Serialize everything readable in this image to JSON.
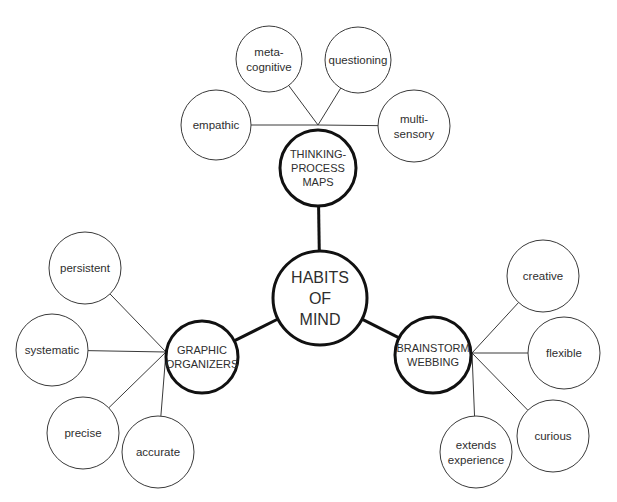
{
  "diagram": {
    "type": "concept-map",
    "center": {
      "id": "habits-of-mind",
      "lines": [
        "HABITS",
        "OF",
        "MIND"
      ],
      "x": 320,
      "y": 298,
      "r": 47
    },
    "branches": [
      {
        "id": "thinking-process-maps",
        "lines": [
          "THINKING-",
          "PROCESS",
          "MAPS"
        ],
        "x": 318,
        "y": 168,
        "r": 38,
        "hub": {
          "x": 318,
          "y": 125
        },
        "leaves": [
          {
            "id": "empathic",
            "lines": [
              "empathic"
            ],
            "x": 216,
            "y": 125,
            "r": 35
          },
          {
            "id": "meta-cognitive",
            "lines": [
              "meta-",
              "cognitive"
            ],
            "x": 269,
            "y": 59,
            "r": 33
          },
          {
            "id": "questioning",
            "lines": [
              "questioning"
            ],
            "x": 358,
            "y": 60,
            "r": 33
          },
          {
            "id": "multi-sensory",
            "lines": [
              "multi-",
              "sensory"
            ],
            "x": 414,
            "y": 126,
            "r": 36
          }
        ]
      },
      {
        "id": "graphic-organizers",
        "lines": [
          "GRAPHIC",
          "ORGANIZERS"
        ],
        "x": 202,
        "y": 357,
        "r": 36,
        "hub": {
          "x": 166,
          "y": 352
        },
        "leaves": [
          {
            "id": "persistent",
            "lines": [
              "persistent"
            ],
            "x": 85,
            "y": 268,
            "r": 36
          },
          {
            "id": "systematic",
            "lines": [
              "systematic"
            ],
            "x": 52,
            "y": 350,
            "r": 36
          },
          {
            "id": "precise",
            "lines": [
              "precise"
            ],
            "x": 83,
            "y": 433,
            "r": 36
          },
          {
            "id": "accurate",
            "lines": [
              "accurate"
            ],
            "x": 158,
            "y": 452,
            "r": 36
          }
        ]
      },
      {
        "id": "brainstorm-webbing",
        "lines": [
          "BRAINSTORM",
          "WEBBING"
        ],
        "x": 433,
        "y": 355,
        "r": 38,
        "hub": {
          "x": 472,
          "y": 353
        },
        "leaves": [
          {
            "id": "creative",
            "lines": [
              "creative"
            ],
            "x": 543,
            "y": 276,
            "r": 36
          },
          {
            "id": "flexible",
            "lines": [
              "flexible"
            ],
            "x": 564,
            "y": 353,
            "r": 36
          },
          {
            "id": "curious",
            "lines": [
              "curious"
            ],
            "x": 553,
            "y": 436,
            "r": 36
          },
          {
            "id": "extends-experience",
            "lines": [
              "extends",
              "experience"
            ],
            "x": 476,
            "y": 452,
            "r": 36
          }
        ]
      }
    ]
  }
}
